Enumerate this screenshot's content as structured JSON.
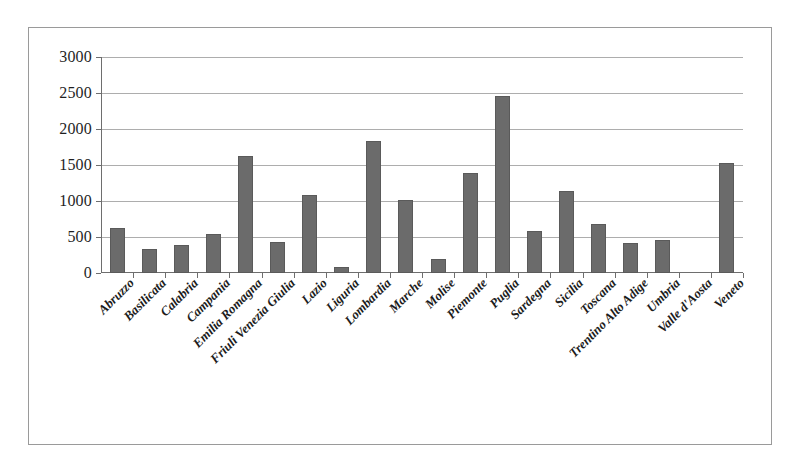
{
  "chart_data": {
    "type": "bar",
    "title": "",
    "subtitle": "",
    "xlabel": "",
    "ylabel": "",
    "ylim": [
      0,
      3000
    ],
    "ytick_step": 500,
    "yticks": [
      "0",
      "500",
      "1000",
      "1500",
      "2000",
      "2500",
      "3000"
    ],
    "grid": true,
    "legend": false,
    "legend_position": "none",
    "bar_color": "#6b6b6b",
    "categories": [
      "Abruzzo",
      "Basilicata",
      "Calabria",
      "Campania",
      "Emilia Romagna",
      "Friuli Venezia Giulia",
      "Lazio",
      "Liguria",
      "Lombardia",
      "Marche",
      "Molise",
      "Piemonte",
      "Puglia",
      "Sardegna",
      "Sicilia",
      "Toscana",
      "Trentino Alto Adige",
      "Umbria",
      "Valle d'Aosta",
      "Veneto"
    ],
    "values": [
      625,
      330,
      390,
      545,
      1620,
      425,
      1080,
      85,
      1840,
      1010,
      190,
      1395,
      2460,
      585,
      1140,
      680,
      410,
      455,
      0,
      1530
    ]
  },
  "figure": {
    "background_color": "#ffffff",
    "frame_color": "#9a9a9a",
    "axis_color": "#6e6e6e",
    "gridline_color": "#adadad"
  }
}
